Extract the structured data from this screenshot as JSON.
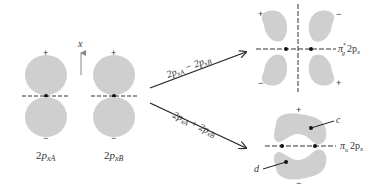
{
  "colors": {
    "lobe": "#cfcfcf",
    "line": "#333333",
    "text": "#333333"
  },
  "axis": {
    "label": "x"
  },
  "atomic_orbitals": [
    {
      "id": "A",
      "label_main": "2",
      "label_p": "p",
      "label_sub": "xA",
      "top_sign": "+",
      "bottom_sign": "−"
    },
    {
      "id": "B",
      "label_main": "2",
      "label_p": "p",
      "label_sub": "xB",
      "top_sign": "+",
      "bottom_sign": "−"
    }
  ],
  "arrows": {
    "upper": {
      "label_a": "2p",
      "sub_a": "xA",
      "op": "−",
      "label_b": "2p",
      "sub_b": "xB"
    },
    "lower": {
      "label_a": "2p",
      "sub_a": "xA",
      "op": "+",
      "label_b": "2p",
      "sub_b": "xB"
    }
  },
  "antibonding": {
    "label_pi": "π",
    "label_sub": "g",
    "label_sup": "*",
    "label_rest": "2p",
    "label_rest_sub": "x",
    "signs": {
      "top_left": "+",
      "top_right": "−",
      "bottom_left": "−",
      "bottom_right": "+"
    }
  },
  "bonding": {
    "label_pi": "π",
    "label_sub": "u",
    "label_rest": "2p",
    "label_rest_sub": "x",
    "signs": {
      "top": "+",
      "bottom": "−"
    },
    "point_labels": {
      "c": "c",
      "d": "d"
    }
  }
}
